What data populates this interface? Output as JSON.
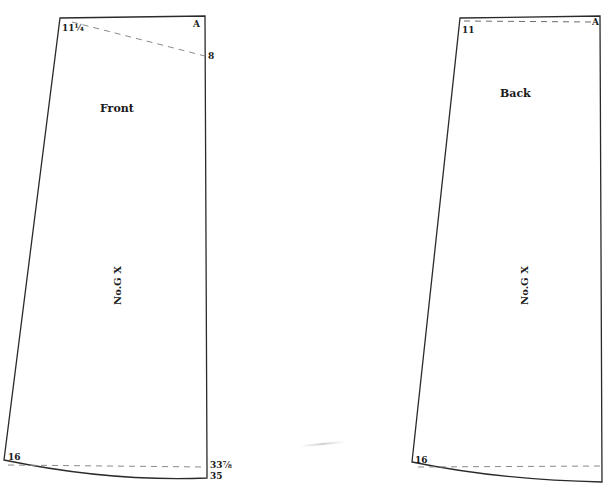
{
  "diagram": {
    "type": "sewing-pattern",
    "line_color": "#2a2a2a",
    "dash_color": "#6a6a6a",
    "background": "#ffffff",
    "pieces": [
      {
        "name": "Front",
        "title": "Front",
        "pattern_no": "No.G X",
        "labels": {
          "top_left": "11¼",
          "top_right": "A",
          "right_dart": "8",
          "bottom_left": "16",
          "bottom_right_upper": "33⅞",
          "bottom_right_lower": "35"
        }
      },
      {
        "name": "Back",
        "title": "Back",
        "pattern_no": "No.G X",
        "labels": {
          "top_left": "11",
          "top_right": "A",
          "bottom_left": "16"
        }
      }
    ]
  }
}
